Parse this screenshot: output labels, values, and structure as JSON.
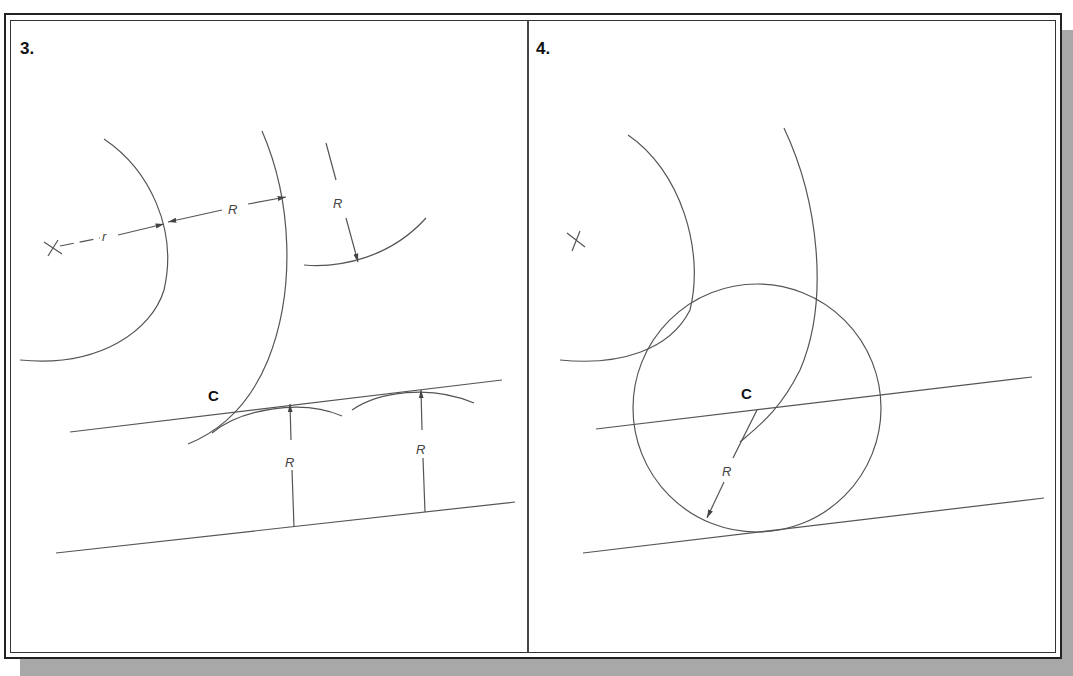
{
  "panels": [
    {
      "label": "3.",
      "point_label": "C",
      "dimension_labels": [
        "r",
        "R",
        "R",
        "R",
        "R"
      ]
    },
    {
      "label": "4.",
      "point_label": "C",
      "dimension_labels": [
        "R"
      ]
    }
  ],
  "colors": {
    "line": "#555555",
    "frame": "#222222",
    "shadow": "#a8a8a8",
    "background": "#ffffff"
  }
}
